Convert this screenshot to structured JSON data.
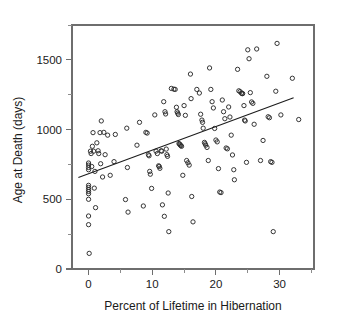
{
  "chart_data": {
    "type": "scatter",
    "title": "",
    "xlabel": "Percent of Lifetime in Hibernation",
    "ylabel": "Age at Death (days)",
    "xlim": [
      -2.6,
      35.4
    ],
    "ylim": [
      0,
      1750
    ],
    "xticks": [
      0,
      10,
      20,
      30
    ],
    "yticks": [
      0,
      500,
      1000,
      1500
    ],
    "xtick_labels": [
      "0",
      "10",
      "20",
      "30"
    ],
    "ytick_labels": [
      "0",
      "500",
      "1000",
      "1500"
    ],
    "grid": false,
    "legend": null,
    "marker": "open-circle",
    "marker_color": "#2b2b2b",
    "series": [
      {
        "name": "Hibernation vs age at death",
        "points": [
          [
            0.0,
            760
          ],
          [
            0.0,
            745
          ],
          [
            0.0,
            728
          ],
          [
            0.0,
            712
          ],
          [
            0.0,
            600
          ],
          [
            0.0,
            585
          ],
          [
            0.0,
            570
          ],
          [
            0.0,
            556
          ],
          [
            0.0,
            540
          ],
          [
            0.0,
            500
          ],
          [
            0.0,
            380
          ],
          [
            0.0,
            318
          ],
          [
            0.1,
            112
          ],
          [
            0.3,
            845
          ],
          [
            0.4,
            828
          ],
          [
            0.5,
            735
          ],
          [
            0.6,
            880
          ],
          [
            0.7,
            978
          ],
          [
            0.8,
            845
          ],
          [
            0.9,
            580
          ],
          [
            1.0,
            700
          ],
          [
            1.1,
            440
          ],
          [
            1.3,
            905
          ],
          [
            1.5,
            848
          ],
          [
            1.6,
            828
          ],
          [
            1.8,
            978
          ],
          [
            1.9,
            755
          ],
          [
            2.0,
            1062
          ],
          [
            2.2,
            660
          ],
          [
            2.4,
            980
          ],
          [
            2.6,
            820
          ],
          [
            3.0,
            960
          ],
          [
            3.4,
            672
          ],
          [
            4.0,
            770
          ],
          [
            4.2,
            965
          ],
          [
            5.8,
            498
          ],
          [
            6.0,
            1010
          ],
          [
            6.1,
            728
          ],
          [
            6.2,
            408
          ],
          [
            7.6,
            888
          ],
          [
            8.0,
            1052
          ],
          [
            8.6,
            452
          ],
          [
            9.0,
            980
          ],
          [
            9.2,
            975
          ],
          [
            9.4,
            820
          ],
          [
            9.5,
            812
          ],
          [
            9.6,
            700
          ],
          [
            9.7,
            680
          ],
          [
            9.9,
            578
          ],
          [
            10.4,
            1105
          ],
          [
            10.6,
            845
          ],
          [
            10.8,
            828
          ],
          [
            11.0,
            740
          ],
          [
            11.1,
            735
          ],
          [
            11.2,
            722
          ],
          [
            11.4,
            848
          ],
          [
            11.5,
            845
          ],
          [
            11.6,
            460
          ],
          [
            11.8,
            1200
          ],
          [
            11.9,
            378
          ],
          [
            12.0,
            1128
          ],
          [
            12.1,
            1112
          ],
          [
            12.2,
            860
          ],
          [
            12.3,
            820
          ],
          [
            12.4,
            808
          ],
          [
            12.5,
            545
          ],
          [
            12.6,
            268
          ],
          [
            13.0,
            1295
          ],
          [
            13.4,
            1290
          ],
          [
            13.6,
            1288
          ],
          [
            13.8,
            1160
          ],
          [
            13.9,
            1128
          ],
          [
            14.0,
            1118
          ],
          [
            14.1,
            1108
          ],
          [
            14.2,
            900
          ],
          [
            14.3,
            895
          ],
          [
            14.4,
            890
          ],
          [
            14.5,
            885
          ],
          [
            14.6,
            880
          ],
          [
            14.8,
            672
          ],
          [
            15.0,
            1172
          ],
          [
            15.2,
            1102
          ],
          [
            15.4,
            778
          ],
          [
            15.6,
            762
          ],
          [
            15.8,
            745
          ],
          [
            16.0,
            1398
          ],
          [
            16.1,
            1222
          ],
          [
            16.2,
            520
          ],
          [
            16.4,
            338
          ],
          [
            17.0,
            1288
          ],
          [
            17.4,
            1262
          ],
          [
            17.6,
            1110
          ],
          [
            17.8,
            1068
          ],
          [
            17.9,
            1052
          ],
          [
            18.0,
            1010
          ],
          [
            18.2,
            908
          ],
          [
            18.3,
            898
          ],
          [
            18.4,
            888
          ],
          [
            18.6,
            872
          ],
          [
            18.8,
            778
          ],
          [
            19.0,
            1442
          ],
          [
            19.2,
            1288
          ],
          [
            19.4,
            1200
          ],
          [
            19.6,
            1155
          ],
          [
            19.8,
            1008
          ],
          [
            20.0,
            925
          ],
          [
            20.2,
            912
          ],
          [
            20.4,
            720
          ],
          [
            20.6,
            552
          ],
          [
            20.8,
            548
          ],
          [
            21.0,
            1212
          ],
          [
            21.2,
            1128
          ],
          [
            21.4,
            1078
          ],
          [
            21.6,
            868
          ],
          [
            21.8,
            862
          ],
          [
            22.0,
            1162
          ],
          [
            22.2,
            1090
          ],
          [
            22.4,
            960
          ],
          [
            22.6,
            818
          ],
          [
            22.8,
            712
          ],
          [
            22.9,
            640
          ],
          [
            23.4,
            1432
          ],
          [
            23.6,
            1278
          ],
          [
            23.8,
            1272
          ],
          [
            24.0,
            1262
          ],
          [
            24.1,
            1258
          ],
          [
            24.2,
            1258
          ],
          [
            24.4,
            1172
          ],
          [
            24.5,
            1068
          ],
          [
            24.6,
            1062
          ],
          [
            24.8,
            765
          ],
          [
            25.0,
            1572
          ],
          [
            25.2,
            1508
          ],
          [
            25.4,
            1265
          ],
          [
            25.6,
            1198
          ],
          [
            25.8,
            1188
          ],
          [
            26.0,
            1038
          ],
          [
            26.4,
            1578
          ],
          [
            27.0,
            778
          ],
          [
            27.4,
            922
          ],
          [
            28.0,
            1382
          ],
          [
            28.2,
            1092
          ],
          [
            28.4,
            1085
          ],
          [
            28.6,
            770
          ],
          [
            28.8,
            765
          ],
          [
            29.0,
            268
          ],
          [
            29.4,
            1275
          ],
          [
            29.6,
            1618
          ],
          [
            30.2,
            1105
          ],
          [
            32.0,
            1368
          ],
          [
            33.0,
            1072
          ]
        ]
      }
    ],
    "fit_line": {
      "name": "least-squares regression line",
      "x_start": -1.6,
      "y_start": 657,
      "x_end": 32.2,
      "y_end": 1228
    }
  }
}
